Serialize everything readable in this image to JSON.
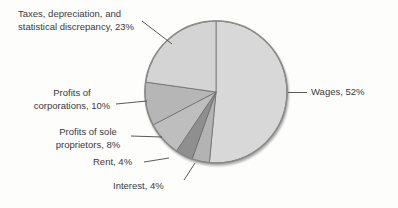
{
  "chart_data": {
    "type": "pie",
    "title": "",
    "start_angle": "top",
    "direction": "clockwise",
    "legend": "none (direct slice labels with leader lines)",
    "background_color": "#fdfdfc",
    "outline_color": "#8a8a8a",
    "slice_border_color": "#6f6f6f",
    "leader_line_color": "#474747",
    "label_text_color": "#3a3a3a",
    "slices": [
      {
        "id": "wages",
        "label": "Wages",
        "pct": 52,
        "display": "Wages, 52%",
        "label_lines": [
          "Wages, 52%"
        ],
        "color": "#d8d8d8"
      },
      {
        "id": "interest",
        "label": "Interest",
        "pct": 4,
        "display": "Interest, 4%",
        "label_lines": [
          "Interest, 4%"
        ],
        "color": "#b3b3b3"
      },
      {
        "id": "rent",
        "label": "Rent",
        "pct": 4,
        "display": "Rent, 4%",
        "label_lines": [
          "Rent, 4%"
        ],
        "color": "#8f8f8f"
      },
      {
        "id": "sole-proprietors",
        "label": "Profits of sole proprietors",
        "pct": 8,
        "display": "Profits of sole proprietors, 8%",
        "label_lines": [
          "Profits of sole",
          "proprietors, 8%"
        ],
        "color": "#bebebe"
      },
      {
        "id": "corporations",
        "label": "Profits of corporations",
        "pct": 10,
        "display": "Profits of corporations, 10%",
        "label_lines": [
          "Profits of",
          "corporations, 10%"
        ],
        "color": "#b6b6b6"
      },
      {
        "id": "taxes",
        "label": "Taxes, depreciation, and statistical discrepancy",
        "pct": 23,
        "display": "Taxes, depreciation, and statistical discrepancy, 23%",
        "label_lines": [
          "Taxes, depreciation, and",
          "statistical discrepancy, 23%"
        ],
        "color": "#d4d4d4"
      }
    ]
  }
}
